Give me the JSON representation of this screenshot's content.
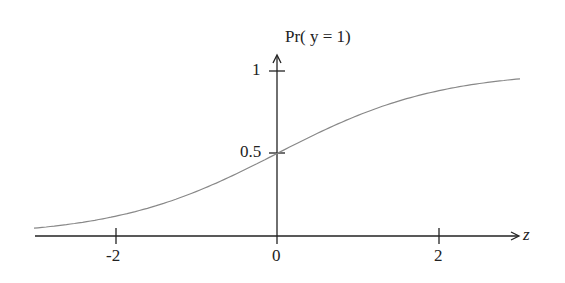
{
  "chart_data": {
    "type": "line",
    "title": "",
    "xlabel": "z",
    "ylabel": "Pr( y = 1)",
    "xlim": [
      -3,
      3
    ],
    "ylim": [
      0,
      1
    ],
    "x_ticks": [
      "-2",
      "0",
      "2"
    ],
    "y_ticks": [
      "0.5",
      "1"
    ],
    "series": [
      {
        "name": "logistic sigmoid",
        "x": [
          -3,
          -2,
          -1,
          0,
          1,
          2,
          3
        ],
        "values": [
          0.047,
          0.119,
          0.269,
          0.5,
          0.731,
          0.881,
          0.953
        ]
      }
    ],
    "grid": false,
    "legend": "none"
  },
  "colors": {
    "axis": "#222222",
    "curve": "#888888"
  }
}
